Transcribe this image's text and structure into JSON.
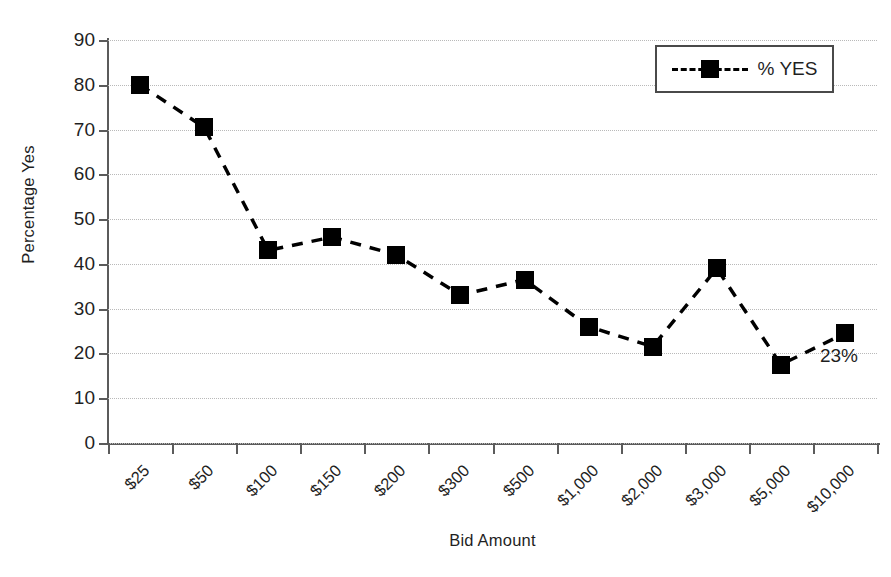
{
  "chart_data": {
    "type": "line",
    "title": "",
    "xlabel": "Bid Amount",
    "ylabel": "Percentage Yes",
    "categories": [
      "$25",
      "$50",
      "$100",
      "$150",
      "$200",
      "$300",
      "$500",
      "$1,000",
      "$2,000",
      "$3,000",
      "$5,000",
      "$10,000"
    ],
    "series": [
      {
        "name": "% YES",
        "values": [
          80,
          70.5,
          43,
          46,
          42,
          33,
          36.5,
          26,
          21.5,
          39,
          17.5,
          24.5
        ],
        "marker": "filled-square",
        "linestyle": "dashed",
        "color": "#000000"
      }
    ],
    "ylim": [
      0,
      90
    ],
    "yticks": [
      0,
      10,
      20,
      30,
      40,
      50,
      60,
      70,
      80,
      90
    ],
    "ytick_labels": [
      "0",
      "10",
      "20",
      "30",
      "40",
      "50",
      "60",
      "70",
      "80",
      "90"
    ],
    "grid": "horizontal-dotted",
    "legend_position": "top-right",
    "annotations": [
      {
        "text": "23%",
        "category": "$10,000",
        "value": 17.5
      }
    ]
  },
  "legend": {
    "entries": [
      {
        "label": "% YES"
      }
    ]
  },
  "colors": {
    "series": "#000000",
    "axis": "#5b5b5b",
    "grid": "#b9b9b9",
    "background": "#ffffff",
    "text": "#1f1f1f"
  }
}
